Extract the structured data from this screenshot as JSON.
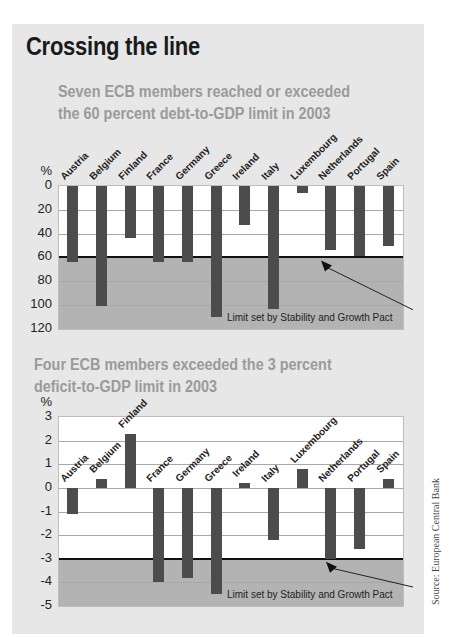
{
  "title": "Crossing the line",
  "source": "Source: European Central Bank",
  "colors": {
    "bar": "#4c4c4c",
    "shade": "#b3b3b3",
    "background": "#e7e7e7",
    "subtitle": "#9a9a9a"
  },
  "chart_data": [
    {
      "type": "bar",
      "title": "Seven ECB members reached or exceeded the 60 percent debt-to-GDP limit in 2003",
      "title_lines": [
        "Seven ECB members reached or exceeded",
        "the 60 percent debt-to-GDP limit in 2003"
      ],
      "ylabel": "%",
      "ylim": [
        0,
        120
      ],
      "y_inverted": true,
      "yticks": [
        0,
        20,
        40,
        60,
        80,
        100,
        120
      ],
      "categories": [
        "Austria",
        "Belgium",
        "Finland",
        "France",
        "Germany",
        "Greece",
        "Ireland",
        "Italy",
        "Luxembourg",
        "Netherlands",
        "Portugal",
        "Spain"
      ],
      "values": [
        64,
        101,
        44,
        64,
        64,
        110,
        33,
        103,
        6,
        54,
        59,
        50
      ],
      "limit": 60,
      "annotation": "Limit set by Stability and Growth Pact",
      "grid": true
    },
    {
      "type": "bar",
      "title": "Four ECB members exceeded the 3 percent deficit-to-GDP limit in 2003",
      "title_lines": [
        "Four ECB members exceeded the 3 percent",
        "deficit-to-GDP limit in 2003"
      ],
      "ylabel": "%",
      "ylim": [
        -5,
        3
      ],
      "yticks": [
        3,
        2,
        1,
        0,
        -1,
        -2,
        -3,
        -4,
        -5
      ],
      "categories": [
        "Austria",
        "Belgium",
        "Finland",
        "France",
        "Germany",
        "Greece",
        "Ireland",
        "Italy",
        "Luxembourg",
        "Netherlands",
        "Portugal",
        "Spain"
      ],
      "values": [
        -1.1,
        0.4,
        2.3,
        -4.0,
        -3.8,
        -4.5,
        0.2,
        -2.2,
        0.8,
        -3.0,
        -2.6,
        0.4
      ],
      "limit": -3,
      "annotation": "Limit set by Stability and Growth Pact",
      "grid": true
    }
  ]
}
